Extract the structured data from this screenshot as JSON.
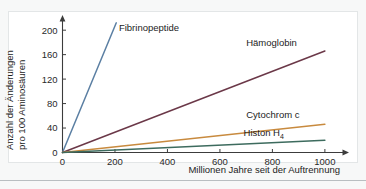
{
  "chart_data": {
    "type": "line",
    "title": "",
    "xlabel": "Millionen Jahre seit der Auftrennung",
    "ylabel": "Anzahl der Änderungen pro 100 Aminosäuren",
    "xlim": [
      0,
      1050
    ],
    "ylim": [
      0,
      215
    ],
    "xticks": [
      0,
      200,
      400,
      600,
      800,
      1000
    ],
    "yticks": [
      0,
      40,
      80,
      120,
      160,
      200
    ],
    "xtick_labels": [
      "0",
      "200",
      "400",
      "600",
      "800",
      "1000"
    ],
    "ytick_labels": [
      "0",
      "40",
      "80",
      "120",
      "160",
      "200"
    ],
    "grid": false,
    "legend": "inline-labels",
    "series": [
      {
        "name": "Fibrinopeptide",
        "label": "Fibrinopeptide",
        "color": "#5b7fa3",
        "x": [
          0,
          205
        ],
        "y": [
          0,
          212
        ],
        "label_x": 215,
        "label_y": 205
      },
      {
        "name": "Hämoglobin",
        "label": "Hämoglobin",
        "color": "#6b3848",
        "x": [
          0,
          1000
        ],
        "y": [
          0,
          166
        ],
        "label_x": 700,
        "label_y": 180
      },
      {
        "name": "Cytochrom c",
        "label": "Cytochrom c",
        "color": "#c88a3e",
        "x": [
          0,
          1000
        ],
        "y": [
          0,
          46
        ],
        "label_x": 700,
        "label_y": 62
      },
      {
        "name": "Histon H4",
        "label": "Histon H",
        "label_subscript": "4",
        "color": "#3d6b5e",
        "x": [
          0,
          1000
        ],
        "y": [
          0,
          20
        ],
        "label_x": 690,
        "label_y": 32
      }
    ]
  }
}
